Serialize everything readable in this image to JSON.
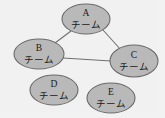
{
  "diagram": {
    "canvas": {
      "width": 165,
      "height": 118,
      "background": "#f1f1f1"
    },
    "node_style": {
      "fill": "#b9b9b9",
      "stroke": "#6a6a6a"
    },
    "edge_style": {
      "stroke": "#6f6f6f"
    },
    "nodes": [
      {
        "id": "A",
        "label_id": "A",
        "label_team": "チーム",
        "cx": 86,
        "cy": 19,
        "rx": 24,
        "ry": 15
      },
      {
        "id": "B",
        "label_id": "B",
        "label_team": "チーム",
        "cx": 39,
        "cy": 54,
        "rx": 25,
        "ry": 15
      },
      {
        "id": "C",
        "label_id": "C",
        "label_team": "チーム",
        "cx": 134,
        "cy": 61,
        "rx": 24,
        "ry": 16
      },
      {
        "id": "D",
        "label_id": "D",
        "label_team": "チーム",
        "cx": 54,
        "cy": 90,
        "rx": 24,
        "ry": 15
      },
      {
        "id": "E",
        "label_id": "E",
        "label_team": "チーム",
        "cx": 111,
        "cy": 98,
        "rx": 24,
        "ry": 15
      }
    ],
    "edges": [
      {
        "id": "edge-a-b",
        "from": "A",
        "to": "B",
        "x1": 71,
        "y1": 31,
        "x2": 55,
        "y2": 43
      },
      {
        "id": "edge-a-c",
        "from": "A",
        "to": "C",
        "x1": 103,
        "y1": 30,
        "x2": 121,
        "y2": 50
      },
      {
        "id": "edge-b-c",
        "from": "B",
        "to": "C",
        "x1": 63,
        "y1": 58,
        "x2": 111,
        "y2": 61
      }
    ]
  }
}
